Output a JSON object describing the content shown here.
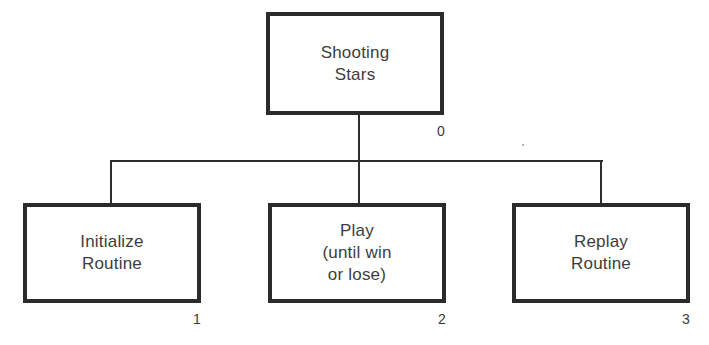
{
  "diagram": {
    "type": "hierarchy-chart",
    "root": {
      "id": "0",
      "label": "Shooting\nStars",
      "number": "0"
    },
    "children": [
      {
        "id": "1",
        "label": "Initialize\nRoutine",
        "number": "1"
      },
      {
        "id": "2",
        "label": "Play\n(until win\nor lose)",
        "number": "2"
      },
      {
        "id": "3",
        "label": "Replay\nRoutine",
        "number": "3"
      }
    ],
    "edges": [
      {
        "from": "0",
        "to": "1"
      },
      {
        "from": "0",
        "to": "2"
      },
      {
        "from": "0",
        "to": "3"
      }
    ],
    "colors": {
      "stroke": "#2b2b2b",
      "text": "#3d3d3d",
      "background": "#ffffff"
    }
  }
}
